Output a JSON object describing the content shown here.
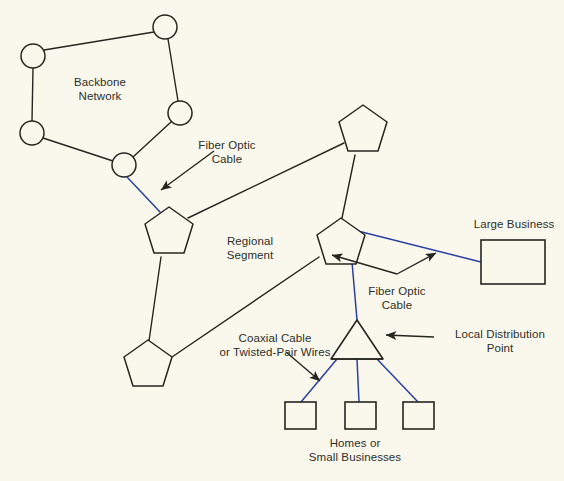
{
  "diagram": {
    "background_color": "#faf8ec",
    "line_color": "#262621",
    "fiber_color": "#2b3fa0",
    "text_color": "#2e2e2a",
    "labels": {
      "backbone_network": "Backbone\nNetwork",
      "fiber_optic_cable_top": "Fiber Optic\nCable",
      "regional_segment": "Regional\nSegment",
      "large_business": "Large Business",
      "fiber_optic_cable_right": "Fiber Optic\nCable",
      "local_distribution_point": "Local Distribution\nPoint",
      "coaxial_cable": "Coaxial Cable\nor Twisted-Pair Wires",
      "homes_or_small_businesses": "Homes or\nSmall Businesses"
    },
    "nodes": {
      "backbone_routers": [
        {
          "name": "backbone-node-top",
          "cx": 165,
          "cy": 27,
          "r": 12
        },
        {
          "name": "backbone-node-upper-left",
          "cx": 33,
          "cy": 56,
          "r": 12
        },
        {
          "name": "backbone-node-right",
          "cx": 180,
          "cy": 113,
          "r": 12
        },
        {
          "name": "backbone-node-lower-left",
          "cx": 32,
          "cy": 133,
          "r": 12
        },
        {
          "name": "backbone-node-bottom",
          "cx": 124,
          "cy": 165,
          "r": 12
        }
      ],
      "regional_switches": [
        {
          "name": "regional-switch-left",
          "cx": 169,
          "cy": 232,
          "r": 25,
          "rot": 0
        },
        {
          "name": "regional-switch-top",
          "cx": 363,
          "cy": 130,
          "r": 25,
          "rot": 0
        },
        {
          "name": "regional-switch-center",
          "cx": 341,
          "cy": 243,
          "r": 25,
          "rot": 0
        },
        {
          "name": "regional-switch-bottom-left",
          "cx": 148,
          "cy": 365,
          "r": 25,
          "rot": 0
        }
      ],
      "local_distribution_point": {
        "name": "local-distribution-point",
        "apex_x": 357,
        "apex_y": 320,
        "base_left_x": 331,
        "base_right_x": 383,
        "base_y": 359
      },
      "large_business": {
        "name": "large-business-box",
        "x": 481,
        "y": 240,
        "w": 64,
        "h": 44
      },
      "homes": [
        {
          "name": "home-box-1",
          "x": 285,
          "y": 402,
          "w": 31,
          "h": 27
        },
        {
          "name": "home-box-2",
          "x": 345,
          "y": 402,
          "w": 31,
          "h": 27
        },
        {
          "name": "home-box-3",
          "x": 403,
          "y": 402,
          "w": 31,
          "h": 27
        }
      ]
    },
    "links": {
      "backbone_black": [
        [
          33,
          56,
          165,
          27
        ],
        [
          165,
          27,
          180,
          113
        ],
        [
          33,
          56,
          32,
          133
        ],
        [
          32,
          133,
          124,
          165
        ],
        [
          124,
          165,
          180,
          113
        ]
      ],
      "fiber_blue": [
        [
          124,
          165,
          160,
          211
        ],
        [
          341,
          226,
          481,
          262
        ],
        [
          352,
          262,
          357,
          320
        ],
        [
          338,
          358,
          300,
          402
        ],
        [
          357,
          359,
          358,
          402
        ],
        [
          376,
          358,
          419,
          402
        ]
      ],
      "regional_black": [
        [
          186,
          216,
          345,
          142
        ],
        [
          345,
          142,
          363,
          105
        ],
        [
          363,
          155,
          363,
          155
        ],
        [
          160,
          256,
          148,
          340
        ],
        [
          173,
          357,
          320,
          256
        ],
        [
          355,
          155,
          341,
          218
        ]
      ]
    },
    "annotations": [
      {
        "name": "arrow-fiber-optic-top",
        "x1": 213,
        "y1": 152,
        "x2": 161,
        "y2": 191
      },
      {
        "name": "arrow-fiber-optic-right",
        "x1": 332,
        "y1": 255,
        "x2": 359,
        "y2": 262
      },
      {
        "name": "arrow-local-distribution-point",
        "x1": 428,
        "y1": 335,
        "x2": 387,
        "y2": 335
      },
      {
        "name": "arrow-coaxial-cable",
        "x1": 287,
        "y1": 353,
        "x2": 318,
        "y2": 379
      }
    ]
  }
}
